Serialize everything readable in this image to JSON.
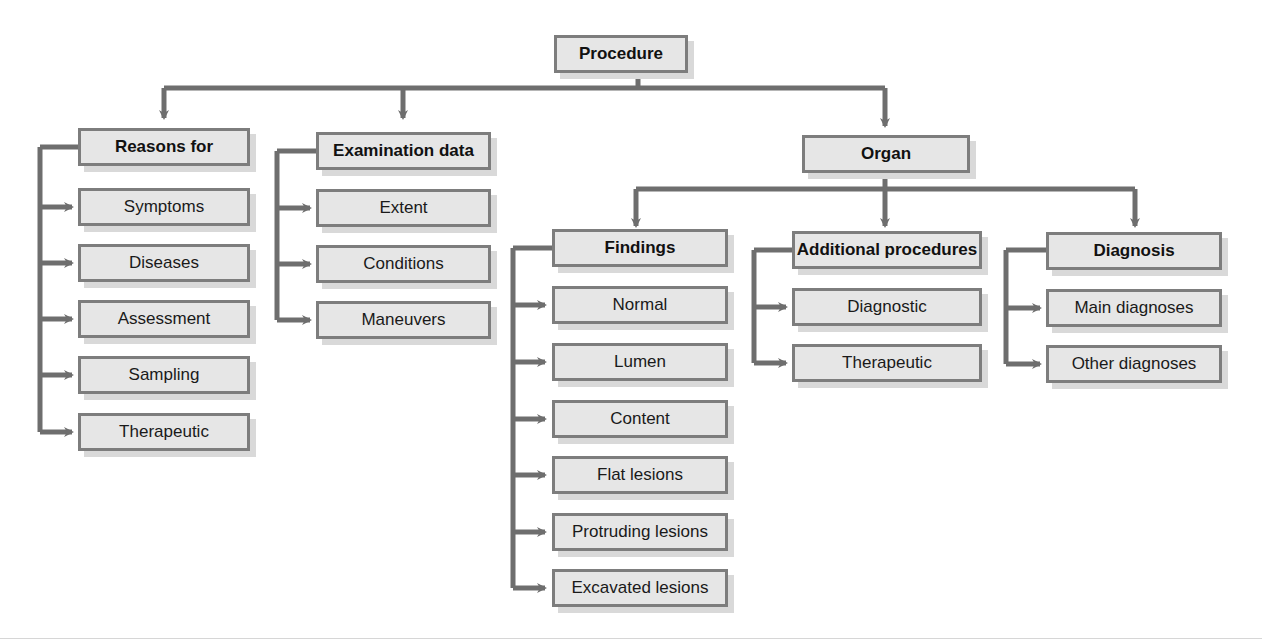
{
  "diagram": {
    "root": {
      "label": "Procedure"
    },
    "level1": [
      {
        "label": "Reasons for",
        "children": [
          "Symptoms",
          "Diseases",
          "Assessment",
          "Sampling",
          "Therapeutic"
        ]
      },
      {
        "label": "Examination data",
        "children": [
          "Extent",
          "Conditions",
          "Maneuvers"
        ]
      },
      {
        "label": "Organ"
      }
    ],
    "organ_children": [
      {
        "label": "Findings",
        "children": [
          "Normal",
          "Lumen",
          "Content",
          "Flat lesions",
          "Protruding lesions",
          "Excavated lesions"
        ]
      },
      {
        "label": "Additional procedures",
        "children": [
          "Diagnostic",
          "Therapeutic"
        ]
      },
      {
        "label": "Diagnosis",
        "children": [
          "Main diagnoses",
          "Other diagnoses"
        ]
      }
    ],
    "colors": {
      "box_fill": "#e6e6e6",
      "box_border": "#7d7d7d",
      "connector": "#6e6e6e",
      "shadow": "#d9d9d9"
    }
  }
}
